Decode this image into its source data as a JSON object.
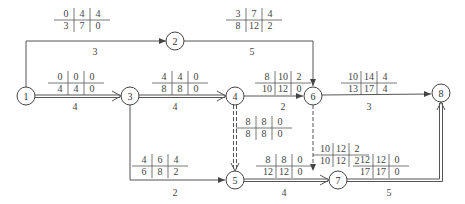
{
  "diagram": {
    "type": "activity-on-arrow network (time parameters)",
    "nodes": [
      {
        "id": "1",
        "x": 26,
        "y": 96
      },
      {
        "id": "2",
        "x": 175,
        "y": 41
      },
      {
        "id": "3",
        "x": 130,
        "y": 96
      },
      {
        "id": "4",
        "x": 235,
        "y": 96
      },
      {
        "id": "5",
        "x": 235,
        "y": 180
      },
      {
        "id": "6",
        "x": 313,
        "y": 96
      },
      {
        "id": "7",
        "x": 338,
        "y": 180
      },
      {
        "id": "8",
        "x": 441,
        "y": 93
      }
    ],
    "activities": [
      {
        "from": "1",
        "to": "2",
        "duration": "3",
        "top": [
          "0",
          "4",
          "4"
        ],
        "bottom": [
          "3",
          "7",
          "0"
        ],
        "critical": false,
        "dummy": false
      },
      {
        "from": "2",
        "to": "6",
        "duration": "5",
        "top": [
          "3",
          "7",
          "4"
        ],
        "bottom": [
          "8",
          "12",
          "2"
        ],
        "critical": false,
        "dummy": false
      },
      {
        "from": "1",
        "to": "3",
        "duration": "4",
        "top": [
          "0",
          "0",
          "0"
        ],
        "bottom": [
          "4",
          "4",
          "0"
        ],
        "critical": true,
        "dummy": false
      },
      {
        "from": "3",
        "to": "4",
        "duration": "4",
        "top": [
          "4",
          "4",
          "0"
        ],
        "bottom": [
          "8",
          "8",
          "0"
        ],
        "critical": true,
        "dummy": false
      },
      {
        "from": "4",
        "to": "6",
        "duration": "2",
        "top": [
          "8",
          "10",
          "2"
        ],
        "bottom": [
          "10",
          "12",
          "0"
        ],
        "critical": false,
        "dummy": false
      },
      {
        "from": "6",
        "to": "8",
        "duration": "3",
        "top": [
          "10",
          "14",
          "4"
        ],
        "bottom": [
          "13",
          "17",
          "4"
        ],
        "critical": false,
        "dummy": false
      },
      {
        "from": "4",
        "to": "5",
        "duration": "",
        "top": [
          "8",
          "8",
          "0"
        ],
        "bottom": [
          "8",
          "8",
          "0"
        ],
        "critical": true,
        "dummy": true
      },
      {
        "from": "6",
        "to": "7",
        "duration": "",
        "top": [
          "10",
          "12",
          "2"
        ],
        "bottom": [
          "10",
          "12",
          "2"
        ],
        "critical": false,
        "dummy": true
      },
      {
        "from": "3",
        "to": "5",
        "duration": "2",
        "top": [
          "4",
          "6",
          "4"
        ],
        "bottom": [
          "6",
          "8",
          "2"
        ],
        "critical": false,
        "dummy": false
      },
      {
        "from": "5",
        "to": "7",
        "duration": "4",
        "top": [
          "8",
          "8",
          "0"
        ],
        "bottom": [
          "12",
          "12",
          "0"
        ],
        "critical": true,
        "dummy": false
      },
      {
        "from": "7",
        "to": "8",
        "duration": "5",
        "top": [
          "12",
          "12",
          "0"
        ],
        "bottom": [
          "17",
          "17",
          "0"
        ],
        "critical": true,
        "dummy": false
      }
    ]
  }
}
